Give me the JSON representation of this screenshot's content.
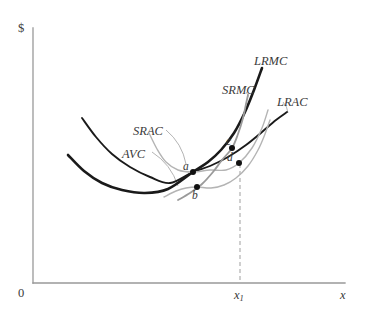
{
  "figure": {
    "background_color": "#ffffff"
  },
  "axes": {
    "y_label": "$",
    "x_label": "x",
    "origin_label": "0",
    "axis_color": "#999999",
    "x_axis": {
      "x_start": 33,
      "x_end": 345,
      "y": 283
    },
    "y_axis": {
      "x": 33,
      "y_start": 28,
      "y_end": 283
    }
  },
  "ticks": [
    {
      "name": "x1",
      "label_html": "x<sub>1</sub>",
      "x": 240,
      "y": 283
    }
  ],
  "guide_lines": [
    {
      "name": "x1-dropline",
      "style": "dashed",
      "color": "#b0b0b0",
      "from": {
        "x": 240,
        "y": 164
      },
      "to": {
        "x": 240,
        "y": 281
      }
    }
  ],
  "curve_labels": [
    {
      "name": "LRMC",
      "text": "LRMC",
      "x": 254,
      "y": 55
    },
    {
      "name": "SRMC",
      "text": "SRMC",
      "x": 222,
      "y": 84
    },
    {
      "name": "LRAC",
      "text": "LRAC",
      "x": 277,
      "y": 96
    },
    {
      "name": "SRAC",
      "text": "SRAC",
      "x": 133,
      "y": 125
    },
    {
      "name": "AVC",
      "text": "AVC",
      "x": 122,
      "y": 148
    }
  ],
  "points": [
    {
      "name": "a",
      "label": "a",
      "x": 193,
      "y": 172,
      "label_x": 183,
      "label_y": 161
    },
    {
      "name": "b",
      "label": "b",
      "x": 197,
      "y": 187,
      "label_x": 192,
      "label_y": 190
    },
    {
      "name": "c",
      "label": "c",
      "x": 232,
      "y": 148,
      "label_x": 226,
      "label_y": 136
    },
    {
      "name": "d",
      "label": "d",
      "x": 239,
      "y": 163,
      "label_x": 227,
      "label_y": 152
    }
  ],
  "chart_data": {
    "type": "line",
    "xlabel": "x",
    "ylabel": "$",
    "grid": false,
    "legend": "inline curve labels",
    "xlim": [
      0,
      345
    ],
    "ylim": [
      0,
      283
    ],
    "note": "Economics cost diagram. Output x on horizontal axis, dollars on vertical axis. Axes drawn in gray with origin labelled 0. A dashed vertical line marks output level x1 and meets point d.",
    "annotations": [
      "SRAC is tangent to LRAC at point a",
      "AVC attains its minimum at point b, directly below a",
      "SRMC crosses LRMC at point c, above output x1",
      "Point d lies on LRAC and SRAC at output x1",
      "LRMC intersects LRAC at its minimum"
    ],
    "series": [
      {
        "name": "LRAC",
        "label": "LRAC",
        "color": "#1a1a1a",
        "width": 1.9,
        "kind": "long-run average cost",
        "path_points": [
          [
            82,
            118
          ],
          [
            96,
            137
          ],
          [
            112,
            154
          ],
          [
            130,
            167
          ],
          [
            150,
            177
          ],
          [
            170,
            183
          ],
          [
            193,
            172
          ],
          [
            210,
            166
          ],
          [
            228,
            157
          ],
          [
            246,
            145
          ],
          [
            262,
            132
          ],
          [
            276,
            120
          ],
          [
            287,
            112
          ]
        ]
      },
      {
        "name": "LRMC",
        "label": "LRMC",
        "color": "#1a1a1a",
        "width": 2.6,
        "kind": "long-run marginal cost",
        "path_points": [
          [
            68,
            155
          ],
          [
            84,
            171
          ],
          [
            102,
            183
          ],
          [
            122,
            190
          ],
          [
            145,
            193
          ],
          [
            168,
            189
          ],
          [
            193,
            172
          ],
          [
            208,
            162
          ],
          [
            221,
            150
          ],
          [
            234,
            133
          ],
          [
            245,
            112
          ],
          [
            254,
            90
          ],
          [
            262,
            68
          ]
        ]
      },
      {
        "name": "SRAC",
        "label": "SRAC",
        "color": "#b4b4b4",
        "width": 1.4,
        "kind": "short-run average cost",
        "path_points": [
          [
            149,
            133
          ],
          [
            157,
            149
          ],
          [
            166,
            162
          ],
          [
            178,
            170
          ],
          [
            193,
            172
          ],
          [
            210,
            170
          ],
          [
            226,
            170
          ],
          [
            239,
            163
          ],
          [
            252,
            148
          ],
          [
            262,
            128
          ],
          [
            268,
            110
          ]
        ]
      },
      {
        "name": "AVC",
        "label": "AVC",
        "color": "#b4b4b4",
        "width": 1.4,
        "kind": "average variable cost",
        "path_points": [
          [
            164,
            197
          ],
          [
            176,
            191
          ],
          [
            186,
            188
          ],
          [
            197,
            187
          ],
          [
            211,
            188
          ],
          [
            224,
            185
          ],
          [
            236,
            178
          ],
          [
            248,
            166
          ],
          [
            258,
            150
          ],
          [
            265,
            134
          ],
          [
            270,
            120
          ]
        ]
      },
      {
        "name": "SRMC",
        "label": "SRMC",
        "color": "#9a9a9a",
        "width": 1.8,
        "kind": "short-run marginal cost",
        "path_points": [
          [
            178,
            200
          ],
          [
            190,
            193
          ],
          [
            202,
            184
          ],
          [
            213,
            172
          ],
          [
            222,
            160
          ],
          [
            232,
            148
          ],
          [
            238,
            134
          ],
          [
            243,
            118
          ],
          [
            246,
            104
          ],
          [
            248,
            95
          ]
        ]
      }
    ],
    "leader_lines": [
      {
        "name": "SRAC-leader",
        "from": [
          166,
          130
        ],
        "to": [
          186,
          164
        ]
      },
      {
        "name": "AVC-leader",
        "from": [
          152,
          152
        ],
        "to": [
          178,
          186
        ]
      },
      {
        "name": "SRMC-leader",
        "from": [
          246,
          92
        ],
        "to": [
          248,
          97
        ]
      },
      {
        "name": "LRAC-leader",
        "from": [
          283,
          102
        ],
        "to": [
          288,
          113
        ]
      }
    ]
  }
}
